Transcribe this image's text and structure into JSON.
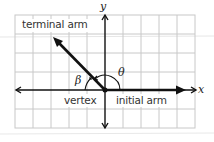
{
  "diagram": {
    "type": "angle in standard position",
    "labels": {
      "terminal_arm": "terminal arm",
      "vertex": "vertex",
      "initial_arm": "initial arm",
      "x_axis": "x",
      "y_axis": "y",
      "theta": "θ",
      "beta": "β"
    },
    "grid": {
      "columns": 10,
      "rows": 6,
      "color": "#c8c8c8"
    },
    "colors": {
      "axis": "#111111",
      "arm": "#111111",
      "grid": "#c8c8c8",
      "text": "#333333"
    }
  }
}
